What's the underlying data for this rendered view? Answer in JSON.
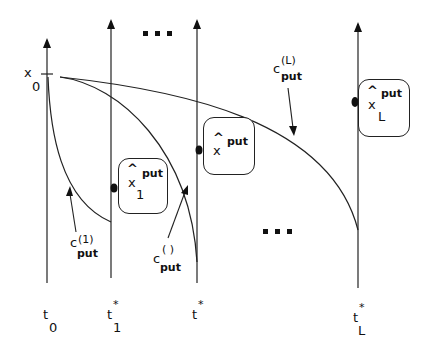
{
  "diagram": {
    "type": "time-axes-exercise-boundary",
    "axes": [
      {
        "id": "t0",
        "label_main": "t",
        "label_sub": "0",
        "label_sup": ""
      },
      {
        "id": "t1",
        "label_main": "t",
        "label_sub": "1",
        "label_sup": "*"
      },
      {
        "id": "tmid",
        "label_main": "t",
        "label_sub": "",
        "label_sup": "*"
      },
      {
        "id": "tL",
        "label_main": "t",
        "label_sub": "L",
        "label_sup": "*"
      }
    ],
    "start_label": {
      "main": "x",
      "sub": "0"
    },
    "ellipsis_top": "▪ ▪ ▪",
    "ellipsis_bottom": "▪ ▪ ▪",
    "curves": [
      {
        "id": "c1",
        "label_main": "c",
        "label_sup": "(1)",
        "label_sub": "put"
      },
      {
        "id": "cmid",
        "label_main": "c",
        "label_sup": "( )",
        "label_sub": "put"
      },
      {
        "id": "cL",
        "label_main": "c",
        "label_sup": "(L)",
        "label_sub": "put"
      }
    ],
    "boxes": [
      {
        "id": "box1",
        "hat": "^",
        "main": "x",
        "sup": "put",
        "sub": "1"
      },
      {
        "id": "boxmid",
        "hat": "^",
        "main": "x",
        "sup": "put",
        "sub": ""
      },
      {
        "id": "boxL",
        "hat": "^",
        "main": "x",
        "sup": "put",
        "sub": "L"
      }
    ],
    "colors": {
      "line": "#222222",
      "background": "#ffffff"
    }
  }
}
